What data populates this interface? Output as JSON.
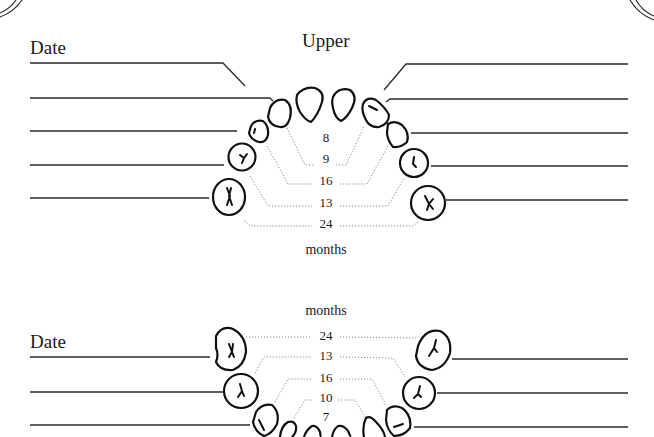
{
  "upper": {
    "title": "Upper",
    "date_label": "Date",
    "units_label": "months",
    "eruption_months": [
      "8",
      "9",
      "16",
      "13",
      "24"
    ]
  },
  "lower": {
    "date_label": "Date",
    "units_label": "months",
    "eruption_months": [
      "24",
      "13",
      "16",
      "10",
      "7"
    ]
  },
  "colors": {
    "line": "#2a2a2a",
    "dotted_leader": "#8a8a8a",
    "tooth_outline": "#111111",
    "background": "#ffffff"
  }
}
